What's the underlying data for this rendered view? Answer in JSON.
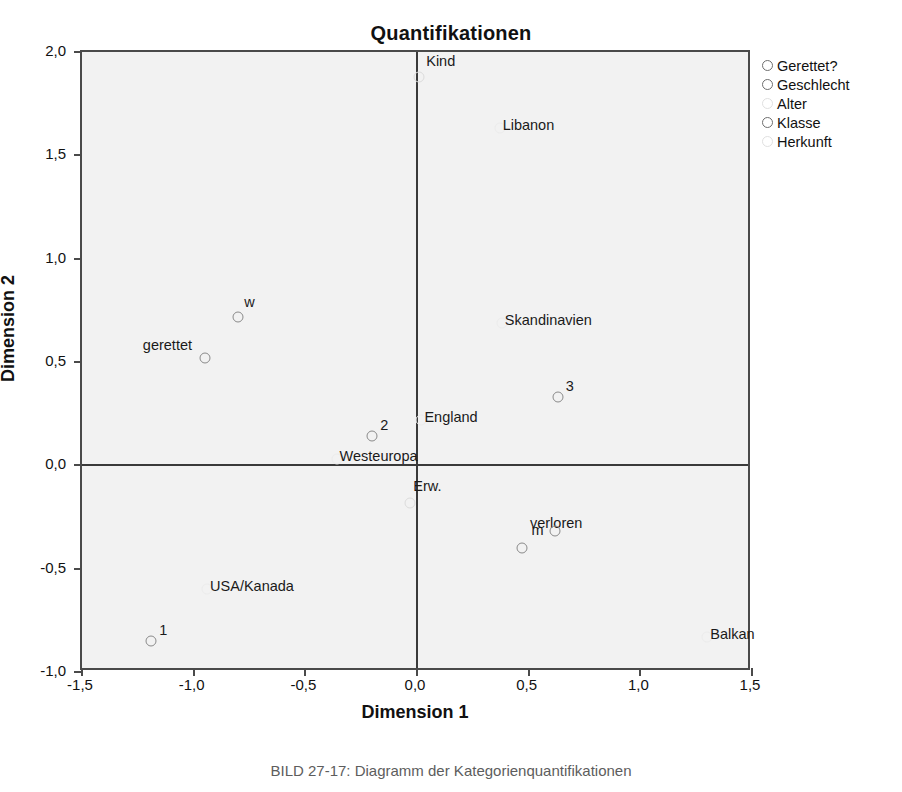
{
  "chart_data": {
    "type": "scatter",
    "title": "Quantifikationen",
    "xlabel": "Dimension 1",
    "ylabel": "Dimension 2",
    "xlim": [
      -1.5,
      1.5
    ],
    "ylim": [
      -1.0,
      2.0
    ],
    "xticks": [
      "-1,5",
      "-1,0",
      "-0,5",
      "0,0",
      "0,5",
      "1,0",
      "1,5"
    ],
    "xtick_values": [
      -1.5,
      -1.0,
      -0.5,
      0.0,
      0.5,
      1.0,
      1.5
    ],
    "yticks": [
      "-1,0",
      "-0,5",
      "0,0",
      "0,5",
      "1,0",
      "1,5",
      "2,0"
    ],
    "ytick_values": [
      -1.0,
      -0.5,
      0.0,
      0.5,
      1.0,
      1.5,
      2.0
    ],
    "grid": false,
    "zero_lines": true,
    "legend_position": "top-right",
    "series": [
      {
        "name": "Gerettet?",
        "marker": "open-circle",
        "color": "#8a8a8a",
        "points": [
          {
            "label": "gerettet",
            "x": -0.95,
            "y": 0.52,
            "label_dx": -62,
            "label_dy": -20
          },
          {
            "label": "verloren",
            "x": 0.47,
            "y": -0.4,
            "label_dx": 8,
            "label_dy": -32
          }
        ]
      },
      {
        "name": "Geschlecht",
        "marker": "open-circle",
        "color": "#8a8a8a",
        "points": [
          {
            "label": "w",
            "x": -0.8,
            "y": 0.72,
            "label_dx": 6,
            "label_dy": -22
          },
          {
            "label": "m",
            "x": 0.62,
            "y": -0.32,
            "label_dx": -24,
            "label_dy": -8
          }
        ]
      },
      {
        "name": "Alter",
        "marker": "open-circle-faint",
        "color": "#dcdcdc",
        "points": [
          {
            "label": "Kind",
            "x": 0.01,
            "y": 1.88,
            "label_dx": 7,
            "label_dy": -23
          },
          {
            "label": "Erw.",
            "x": -0.03,
            "y": -0.18,
            "label_dx": 3,
            "label_dy": -24
          }
        ]
      },
      {
        "name": "Klasse",
        "marker": "open-circle",
        "color": "#8a8a8a",
        "points": [
          {
            "label": "1",
            "x": -1.19,
            "y": -0.85,
            "label_dx": 8,
            "label_dy": -18
          },
          {
            "label": "2",
            "x": -0.2,
            "y": 0.14,
            "label_dx": 8,
            "label_dy": -18
          },
          {
            "label": "3",
            "x": 0.63,
            "y": 0.33,
            "label_dx": 8,
            "label_dy": -18
          }
        ]
      },
      {
        "name": "Herkunft",
        "marker": "open-circle-faint",
        "color": "#ececec",
        "points": [
          {
            "label": "Libanon",
            "x": 0.37,
            "y": 1.63,
            "label_dx": 3,
            "label_dy": -10
          },
          {
            "label": "Skandinavien",
            "x": 0.38,
            "y": 0.69,
            "label_dx": 3,
            "label_dy": -10
          },
          {
            "label": "England",
            "x": 0.02,
            "y": 0.22,
            "label_dx": 3,
            "label_dy": -10
          },
          {
            "label": "Westeuropa",
            "x": -0.36,
            "y": 0.03,
            "label_dx": 3,
            "label_dy": -10
          },
          {
            "label": "USA/Kanada",
            "x": -0.94,
            "y": -0.6,
            "label_dx": 3,
            "label_dy": -10
          },
          {
            "label": "Balkan",
            "x": 1.3,
            "y": -0.83,
            "label_dx": 3,
            "label_dy": -10
          }
        ]
      }
    ]
  },
  "legend": {
    "items": [
      {
        "label": "Gerettet?",
        "faint": false
      },
      {
        "label": "Geschlecht",
        "faint": false
      },
      {
        "label": "Alter",
        "faint": true
      },
      {
        "label": "Klasse",
        "faint": false
      },
      {
        "label": "Herkunft",
        "faint": true
      }
    ]
  },
  "caption": {
    "text": "BILD 27-17: Diagramm der Kategorienquantifikationen"
  }
}
